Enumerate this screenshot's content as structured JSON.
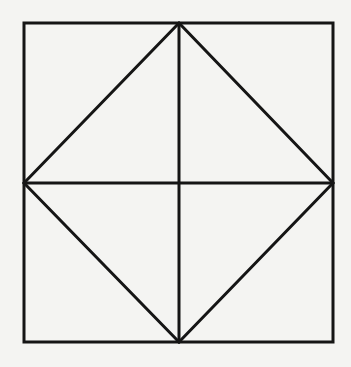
{
  "figure": {
    "width": 351,
    "height": 367,
    "background": "#f4f4f2",
    "stroke_color": "#151515",
    "stroke_width": 3,
    "square": {
      "x1": 24,
      "y1": 23,
      "x2": 333,
      "y2": 342
    },
    "points": {
      "top_mid": [
        179,
        23
      ],
      "bottom_mid": [
        179,
        342
      ],
      "left_mid": [
        24,
        183
      ],
      "right_mid": [
        333,
        183
      ]
    },
    "segments": [
      {
        "name": "vertical-midline",
        "from": "top_mid",
        "to": "bottom_mid"
      },
      {
        "name": "horizontal-midline",
        "from": "left_mid",
        "to": "right_mid"
      },
      {
        "name": "diamond-edge-top-left",
        "from": "top_mid",
        "to": "left_mid"
      },
      {
        "name": "diamond-edge-top-right",
        "from": "top_mid",
        "to": "right_mid"
      },
      {
        "name": "diamond-edge-bottom-left",
        "from": "left_mid",
        "to": "bottom_mid"
      },
      {
        "name": "diamond-edge-bottom-right",
        "from": "right_mid",
        "to": "bottom_mid"
      }
    ]
  }
}
